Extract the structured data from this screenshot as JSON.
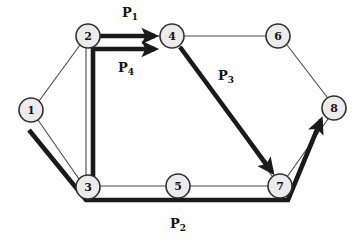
{
  "diagram": {
    "background_color": "#fefefe",
    "node_fill": "#ebebeb",
    "node_stroke": "#303030",
    "thin_edge_color": "#4a4a4a",
    "thick_edge_color": "#1a1a1a",
    "nodes": [
      {
        "id": "1",
        "label": "1",
        "cx": 31,
        "cy": 110,
        "r": 12
      },
      {
        "id": "2",
        "label": "2",
        "cx": 88,
        "cy": 36,
        "r": 12
      },
      {
        "id": "3",
        "label": "3",
        "cx": 88,
        "cy": 187,
        "r": 12
      },
      {
        "id": "4",
        "label": "4",
        "cx": 172,
        "cy": 36,
        "r": 12
      },
      {
        "id": "5",
        "label": "5",
        "cx": 178,
        "cy": 186,
        "r": 12
      },
      {
        "id": "6",
        "label": "6",
        "cx": 278,
        "cy": 36,
        "r": 12
      },
      {
        "id": "7",
        "label": "7",
        "cx": 280,
        "cy": 186,
        "r": 12
      },
      {
        "id": "8",
        "label": "8",
        "cx": 334,
        "cy": 108,
        "r": 12
      }
    ],
    "thin_edges": [
      {
        "from": "1",
        "to": "2",
        "name": "edge-1-2"
      },
      {
        "from": "1",
        "to": "3",
        "name": "edge-1-3"
      },
      {
        "from": "2",
        "to": "3",
        "name": "edge-2-3"
      },
      {
        "from": "2",
        "to": "4",
        "name": "edge-2-4"
      },
      {
        "from": "4",
        "to": "6",
        "name": "edge-4-6"
      },
      {
        "from": "4",
        "to": "7",
        "name": "edge-4-7"
      },
      {
        "from": "3",
        "to": "5",
        "name": "edge-3-5"
      },
      {
        "from": "5",
        "to": "7",
        "name": "edge-5-7"
      },
      {
        "from": "6",
        "to": "8",
        "name": "edge-6-8"
      },
      {
        "from": "7",
        "to": "8",
        "name": "edge-7-8"
      }
    ],
    "paths": [
      {
        "id": "P1",
        "label_base": "P",
        "label_sub": "1",
        "label_x": 122,
        "label_y": 17,
        "route": "2 -> 4",
        "name": "path-p1"
      },
      {
        "id": "P4",
        "label_base": "P",
        "label_sub": "4",
        "label_x": 118,
        "label_y": 72,
        "route": "3 -> 2 -> 4",
        "name": "path-p4"
      },
      {
        "id": "P3",
        "label_base": "P",
        "label_sub": "3",
        "label_x": 218,
        "label_y": 80,
        "route": "4 -> 7",
        "name": "path-p3"
      },
      {
        "id": "P2",
        "label_base": "P",
        "label_sub": "2",
        "label_x": 170,
        "label_y": 228,
        "route": "1 -> 3 -> 7 -> 8",
        "name": "path-p2"
      }
    ]
  }
}
